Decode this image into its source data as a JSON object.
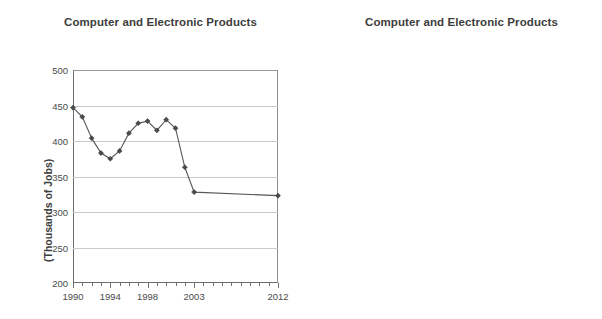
{
  "chart_data": [
    {
      "type": "line",
      "id": "left",
      "title": "Computer and Electronic Products",
      "xlabel": "",
      "ylabel": "(Thousands of Jobs)",
      "ylim": [
        200,
        500
      ],
      "ytick_labels": [
        "500",
        "450",
        "400",
        "350",
        "300",
        "250",
        "200"
      ],
      "ytick_values": [
        500,
        450,
        400,
        350,
        300,
        250,
        200
      ],
      "xlim": [
        1990,
        2012
      ],
      "xtick_labels": [
        "1990",
        "1994",
        "1998",
        "2003",
        "2012"
      ],
      "xtick_values": [
        1990,
        1994,
        1998,
        2003,
        2012
      ],
      "grid": true,
      "legend": "none",
      "x": [
        1990,
        1991,
        1992,
        1993,
        1994,
        1995,
        1996,
        1997,
        1998,
        1999,
        2000,
        2001,
        2002,
        2003,
        2012
      ],
      "values": [
        447,
        434,
        404,
        383,
        375,
        386,
        411,
        425,
        428,
        415,
        430,
        418,
        363,
        328,
        323
      ]
    },
    {
      "type": "line",
      "id": "right",
      "title": "Computer and Electronic Products",
      "xlabel": "",
      "ylabel": "(CA Jobs as % U.S.)",
      "ylim": [
        22,
        28
      ],
      "ytick_labels": [
        "28%",
        "26%",
        "24%",
        "22%"
      ],
      "ytick_values": [
        28,
        26,
        24,
        22
      ],
      "xlim": [
        1990,
        2012
      ],
      "xtick_labels": [
        "1990",
        "1994",
        "1998",
        "2003",
        "2012"
      ],
      "xtick_values": [
        1990,
        1994,
        1998,
        2003,
        2012
      ],
      "grid": true,
      "legend": "none",
      "x": [
        1990,
        1991,
        1992,
        1993,
        1994,
        1995,
        1996,
        1997,
        1998,
        1999,
        2000,
        2001,
        2002,
        2003,
        2012
      ],
      "values": [
        23.4,
        24.0,
        23.7,
        23.1,
        22.6,
        22.8,
        23.4,
        23.5,
        23.3,
        23.6,
        23.8,
        23.75,
        23.9,
        24.0,
        24.1
      ]
    }
  ],
  "panels": {
    "left": {
      "title": "Computer and Electronic Products",
      "y_axis_title": "(Thousands of Jobs)"
    },
    "right": {
      "title": "Computer and Electronic Products",
      "y_axis_title": "(CA Jobs as % U.S.)"
    }
  },
  "colors": {
    "line": "#555555",
    "marker": "#4a4a4a",
    "grid": "#c9c9c9",
    "axis": "#6d6d6d",
    "text": "#3d3d3d",
    "background": "#ffffff"
  }
}
